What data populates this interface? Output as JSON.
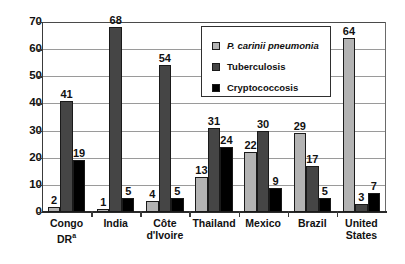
{
  "chart_data": {
    "type": "bar",
    "title": "",
    "xlabel": "",
    "ylabel": "",
    "ylim": [
      0,
      70
    ],
    "yticks": [
      0,
      10,
      20,
      30,
      40,
      50,
      60,
      70
    ],
    "grid": true,
    "legend_position": "upper-center-right",
    "categories": [
      "Congo DR",
      "India",
      "Côte d'Ivoire",
      "Thailand",
      "Mexico",
      "Brazil",
      "United States"
    ],
    "category_notes": [
      "a",
      "",
      "",
      "",
      "",
      "",
      ""
    ],
    "series": [
      {
        "name": "P. carinii pneumonia",
        "color": "#b3b3b3",
        "italic": true,
        "values": [
          2,
          1,
          4,
          13,
          22,
          29,
          64
        ]
      },
      {
        "name": "Tuberculosis",
        "color": "#454545",
        "italic": false,
        "values": [
          41,
          68,
          54,
          31,
          30,
          17,
          3
        ]
      },
      {
        "name": "Cryptococcosis",
        "color": "#000000",
        "italic": false,
        "values": [
          19,
          5,
          5,
          24,
          9,
          5,
          7
        ]
      }
    ]
  }
}
